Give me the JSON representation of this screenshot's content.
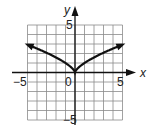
{
  "chart_data": {
    "type": "line",
    "title": "",
    "function": "y = x^(2/3)",
    "xlabel": "x",
    "ylabel": "y",
    "xlim": [
      -5,
      5
    ],
    "ylim": [
      -5,
      5
    ],
    "grid": true,
    "grid_step": 1,
    "tick_labels": {
      "x": [
        "-5",
        "0",
        "5"
      ],
      "y": [
        "5",
        "-5"
      ]
    },
    "series": [
      {
        "name": "curve",
        "x": [
          -5,
          -4,
          -3,
          -2,
          -1,
          -0.5,
          0,
          0.5,
          1,
          2,
          3,
          4,
          5
        ],
        "y": [
          2.92,
          2.52,
          2.08,
          1.59,
          1.0,
          0.63,
          0,
          0.63,
          1.0,
          1.59,
          2.08,
          2.52,
          2.92
        ],
        "arrows_at_ends": true
      }
    ],
    "colors": {
      "grid": "#8a8a8a",
      "axes": "#111111",
      "curve": "#111111"
    }
  },
  "labels": {
    "x_axis": "x",
    "y_axis": "y",
    "x_min": "−5",
    "x_origin": "0",
    "x_max": "5",
    "y_max": "5",
    "y_min": "−5"
  }
}
